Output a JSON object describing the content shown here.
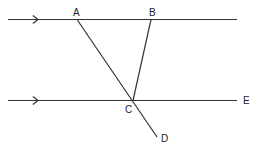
{
  "diagram": {
    "type": "geometry-parallel-lines",
    "lines": [
      {
        "name": "top-parallel-line",
        "arrow": true
      },
      {
        "name": "bottom-parallel-line",
        "arrow": true
      }
    ],
    "points": {
      "A": {
        "label": "A"
      },
      "B": {
        "label": "B"
      },
      "C": {
        "label": "C"
      },
      "D": {
        "label": "D"
      },
      "E": {
        "label": "E"
      }
    },
    "segments": [
      "AD",
      "BC",
      "CE"
    ]
  }
}
